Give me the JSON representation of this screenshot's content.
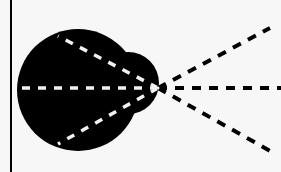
{
  "diagram": {
    "colors": {
      "background": "#f7f7f7",
      "shape_fill": "#000000",
      "inner_dash": "#f2f2f2",
      "outer_dash": "#000000",
      "border_line": "#000000"
    },
    "vertex": {
      "x": 158,
      "y": 88
    },
    "left_border": {
      "x": 11,
      "y1": 0,
      "y2": 172
    },
    "shapes": [
      {
        "name": "large-circle",
        "cx": 78,
        "cy": 90,
        "r": 61
      },
      {
        "name": "small-circle",
        "cx": 128,
        "cy": 83,
        "r": 31
      }
    ],
    "inner_rays": [
      {
        "name": "upper-inner-ray",
        "x1": 158,
        "y1": 88,
        "x2": 58,
        "y2": 36
      },
      {
        "name": "middle-inner-ray",
        "x1": 158,
        "y1": 88,
        "x2": 22,
        "y2": 88
      },
      {
        "name": "lower-inner-ray",
        "x1": 158,
        "y1": 88,
        "x2": 58,
        "y2": 144
      }
    ],
    "outer_rays": [
      {
        "name": "upper-outer-ray",
        "x1": 158,
        "y1": 88,
        "x2": 270,
        "y2": 28
      },
      {
        "name": "middle-outer-ray",
        "x1": 158,
        "y1": 88,
        "x2": 281,
        "y2": 88
      },
      {
        "name": "lower-outer-ray",
        "x1": 158,
        "y1": 88,
        "x2": 272,
        "y2": 152
      }
    ]
  }
}
